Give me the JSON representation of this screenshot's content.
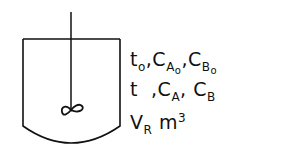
{
  "diagram": {
    "type": "stirred batch reactor",
    "colors": {
      "line": "#111111",
      "background": "#ffffff"
    },
    "labels": {
      "initial": {
        "t": "t",
        "t_sub": "o",
        "ca": "C",
        "ca_sub": "A",
        "ca_subsub": "o",
        "cb": "C",
        "cb_sub": "B",
        "cb_subsub": "o"
      },
      "current": {
        "t": "t",
        "ca": "C",
        "ca_sub": "A",
        "cb": "C",
        "cb_sub": "B"
      },
      "volume": {
        "v": "V",
        "v_sub": "R",
        "unit": "m",
        "unit_sup": "3"
      }
    },
    "separator": ","
  }
}
